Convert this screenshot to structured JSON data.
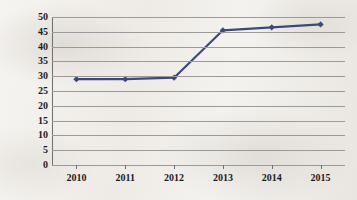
{
  "chart_data": {
    "type": "line",
    "title": "",
    "xlabel": "",
    "ylabel": "个体经营数量(个)",
    "categories": [
      "2010",
      "2011",
      "2012",
      "2013",
      "2014",
      "2015"
    ],
    "values": [
      29,
      29,
      29.5,
      45.5,
      46.5,
      47.5
    ],
    "series": [
      {
        "name": "个体经营数量",
        "values": [
          29,
          29,
          29.5,
          45.5,
          46.5,
          47.5
        ]
      }
    ],
    "ylim": [
      0,
      50
    ],
    "ytick_labels": [
      "0",
      "5",
      "10",
      "15",
      "20",
      "25",
      "30",
      "35",
      "40",
      "45",
      "50"
    ],
    "ytick_values": [
      0,
      5,
      10,
      15,
      20,
      25,
      30,
      35,
      40,
      45,
      50
    ],
    "grid": true,
    "legend": "none",
    "line_color": "#3c4a79",
    "marker": "diamond",
    "marker_color": "#3c4a79",
    "gridline_color": "#9a9a9a",
    "background_color": "#f1eeea"
  }
}
